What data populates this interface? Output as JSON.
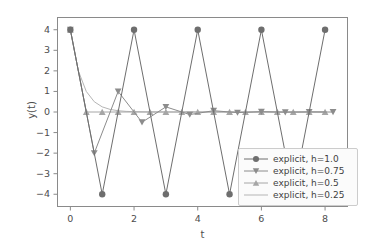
{
  "chart_data": {
    "type": "line",
    "title": "",
    "xlabel": "t",
    "ylabel": "y(t)",
    "xlim": [
      -0.42,
      8.72
    ],
    "ylim": [
      -4.62,
      4.62
    ],
    "xticks": [
      0,
      2,
      4,
      6,
      8
    ],
    "yticks": [
      4,
      3,
      2,
      1,
      0,
      -1,
      -2,
      -3,
      -4
    ],
    "xtick_labels": [
      "0",
      "2",
      "4",
      "6",
      "8"
    ],
    "ytick_labels": [
      "4",
      "3",
      "2",
      "1",
      "0",
      "−1",
      "−2",
      "−3",
      "−4"
    ],
    "grid": false,
    "legend_position": "lower right",
    "series": [
      {
        "name": "explicit, h=1.0",
        "marker": "circle",
        "color": "#6e6e6e",
        "linewidth": 1.0,
        "x": [
          0,
          1,
          2,
          3,
          4,
          5,
          6,
          7,
          8
        ],
        "y": [
          4,
          -4,
          4,
          -4,
          4,
          -4,
          4,
          -4,
          4
        ]
      },
      {
        "name": "explicit, h=0.75",
        "marker": "triangle-down",
        "color": "#8c8c8c",
        "linewidth": 1.0,
        "x": [
          0,
          0.75,
          1.5,
          2.25,
          3,
          3.75,
          4.5,
          5.25,
          6,
          6.75,
          7.5,
          8.25
        ],
        "y": [
          4,
          -2,
          1,
          -0.5,
          0.25,
          -0.125,
          0.0625,
          -0.031,
          0.016,
          -0.008,
          0.004,
          -0.002
        ]
      },
      {
        "name": "explicit, h=0.5",
        "marker": "triangle-up",
        "color": "#a6a6a6",
        "linewidth": 1.0,
        "x": [
          0,
          0.5,
          1,
          1.5,
          2,
          2.5,
          3,
          3.5,
          4,
          4.5,
          5,
          5.5,
          6,
          6.5,
          7,
          7.5,
          8
        ],
        "y": [
          4,
          0,
          0,
          0,
          0,
          0,
          0,
          0,
          0,
          0,
          0,
          0,
          0,
          0,
          0,
          0,
          0
        ]
      },
      {
        "name": "explicit, h=0.25",
        "marker": "none",
        "color": "#b5b5b5",
        "linewidth": 1.0,
        "x": [
          0,
          0.25,
          0.5,
          0.75,
          1,
          1.25,
          1.5,
          1.75,
          2,
          2.25,
          2.5,
          2.75,
          3,
          3.25,
          3.5,
          3.75,
          4,
          4.25,
          4.5,
          4.75,
          5,
          5.25,
          5.5,
          5.75,
          6,
          6.25,
          6.5,
          6.75,
          7,
          7.25,
          7.5,
          7.75,
          8
        ],
        "y": [
          4,
          2,
          1,
          0.5,
          0.25,
          0.125,
          0.0625,
          0.031,
          0.016,
          0.008,
          0.004,
          0.002,
          0.001,
          0.0005,
          0.0002,
          0.0001,
          0,
          0,
          0,
          0,
          0,
          0,
          0,
          0,
          0,
          0,
          0,
          0,
          0,
          0,
          0,
          0,
          0
        ]
      }
    ]
  },
  "axes": {
    "spine_color": "#8a8a8a",
    "tick_color": "#8a8a8a",
    "background": "#ffffff",
    "figure_background": "#ffffff"
  },
  "legend": {
    "entries": [
      {
        "label": "explicit, h=1.0"
      },
      {
        "label": "explicit, h=0.75"
      },
      {
        "label": "explicit, h=0.5"
      },
      {
        "label": "explicit, h=0.25"
      }
    ]
  }
}
